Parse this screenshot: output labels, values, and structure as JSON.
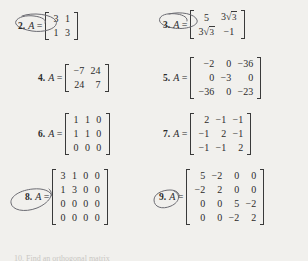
{
  "page": {
    "background_color": "#f1f0ed",
    "ink_color": "#2b2b2b",
    "annotation_color": "#6b6b72",
    "variable_label": "A",
    "equals_sign": "=",
    "footer_partial_text": "10. Find an orthogonal matrix"
  },
  "problems": [
    {
      "number": "2.",
      "variable": "A",
      "circled": true,
      "rows": 2,
      "cols": 2,
      "align": "center",
      "cells": [
        [
          "3",
          "1"
        ],
        [
          "1",
          "3"
        ]
      ]
    },
    {
      "number": "3.",
      "variable": "A",
      "circled": true,
      "rows": 2,
      "cols": 2,
      "align": "center",
      "cells": [
        [
          "5",
          "3√3"
        ],
        [
          "3√3",
          "−1"
        ]
      ],
      "radical_cells": [
        {
          "row": 0,
          "col": 1,
          "coefficient": "3",
          "radicand": "3"
        },
        {
          "row": 1,
          "col": 0,
          "coefficient": "3",
          "radicand": "3"
        }
      ]
    },
    {
      "number": "4.",
      "variable": "A",
      "circled": false,
      "rows": 2,
      "cols": 2,
      "align": "right",
      "cells": [
        [
          "−7",
          "24"
        ],
        [
          "24",
          "7"
        ]
      ]
    },
    {
      "number": "5.",
      "variable": "A",
      "circled": false,
      "rows": 3,
      "cols": 3,
      "align": "right",
      "cells": [
        [
          "−2",
          "0",
          "−36"
        ],
        [
          "0",
          "−3",
          "0"
        ],
        [
          "−36",
          "0",
          "−23"
        ]
      ]
    },
    {
      "number": "6.",
      "variable": "A",
      "circled": false,
      "rows": 3,
      "cols": 3,
      "align": "center",
      "cells": [
        [
          "1",
          "1",
          "0"
        ],
        [
          "1",
          "1",
          "0"
        ],
        [
          "0",
          "0",
          "0"
        ]
      ]
    },
    {
      "number": "7.",
      "variable": "A",
      "circled": false,
      "rows": 3,
      "cols": 3,
      "align": "right",
      "cells": [
        [
          "2",
          "−1",
          "−1"
        ],
        [
          "−1",
          "2",
          "−1"
        ],
        [
          "−1",
          "−1",
          "2"
        ]
      ]
    },
    {
      "number": "8.",
      "variable": "A",
      "circled": true,
      "rows": 4,
      "cols": 4,
      "align": "center",
      "cells": [
        [
          "3",
          "1",
          "0",
          "0"
        ],
        [
          "1",
          "3",
          "0",
          "0"
        ],
        [
          "0",
          "0",
          "0",
          "0"
        ],
        [
          "0",
          "0",
          "0",
          "0"
        ]
      ]
    },
    {
      "number": "9.",
      "variable": "A",
      "circled": true,
      "rows": 4,
      "cols": 4,
      "align": "right",
      "cells": [
        [
          "5",
          "−2",
          "0",
          "0"
        ],
        [
          "−2",
          "2",
          "0",
          "0"
        ],
        [
          "0",
          "0",
          "5",
          "−2"
        ],
        [
          "0",
          "0",
          "−2",
          "2"
        ]
      ]
    }
  ]
}
